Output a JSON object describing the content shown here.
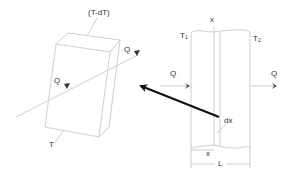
{
  "diagram": {
    "type": "heat-conduction-schematic",
    "colors": {
      "line": "#c8c8c8",
      "text": "#333333",
      "pointer_arrow": "#111111",
      "background": "#ffffff"
    },
    "element_box": {
      "top_label": "(T-dT)",
      "bottom_label": "T",
      "inflow_label": "Q",
      "outflow_label": "Q"
    },
    "slab": {
      "left_temp_label": "T",
      "left_temp_sub": "1",
      "right_temp_label": "T",
      "right_temp_sub": "2",
      "position_label_top": "x",
      "inflow_label": "Q",
      "outflow_label": "Q",
      "element_thickness_label": "dx",
      "position_label_bottom": "x",
      "thickness_label": "L"
    }
  }
}
